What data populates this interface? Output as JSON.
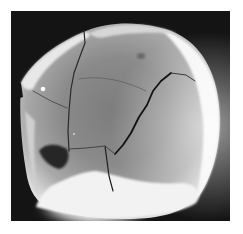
{
  "image": {
    "subject": "skull-specimen-photograph",
    "style": "grayscale",
    "colors": {
      "page_background": "#ffffff",
      "photo_background": "#141414",
      "bone_highlight": "#f4f4f4",
      "bone_midtone": "#8e8e8e",
      "bone_shadow": "#5a5a5a",
      "fracture_line": "#1c1c1c"
    },
    "frame": {
      "x": 11,
      "y": 11,
      "width": 219,
      "height": 210
    }
  }
}
